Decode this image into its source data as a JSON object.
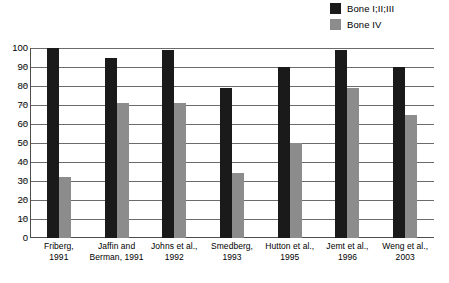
{
  "chart_data": {
    "type": "bar",
    "title": "",
    "subtitle": "",
    "xlabel": "",
    "ylabel": "",
    "ylim": [
      0,
      100
    ],
    "ytick_step": 10,
    "yticks": [
      100,
      90,
      80,
      70,
      60,
      50,
      40,
      30,
      20,
      10,
      0
    ],
    "grid": true,
    "legend_position": "top-right",
    "categories": [
      "Friberg, 1991",
      "Jaffin and Berman, 1991",
      "Johns et al., 1992",
      "Smedberg, 1993",
      "Hutton et al., 1995",
      "Jemt et al., 1996",
      "Weng et al., 2003"
    ],
    "category_lines": [
      [
        "Friberg,",
        "1991"
      ],
      [
        "Jaffin and",
        "Berman, 1991"
      ],
      [
        "Johns et al.,",
        "1992"
      ],
      [
        "Smedberg,",
        "1993"
      ],
      [
        "Hutton et al.,",
        "1995"
      ],
      [
        "Jemt et al.,",
        "1996"
      ],
      [
        "Weng et al.,",
        "2003"
      ]
    ],
    "series": [
      {
        "name": "Bone I;II;III",
        "color": "#1a1a1a",
        "values": [
          100,
          95,
          99,
          79,
          90,
          99,
          90
        ]
      },
      {
        "name": "Bone IV",
        "color": "#8c8c8c",
        "values": [
          32,
          71,
          71,
          34,
          50,
          79,
          65
        ]
      }
    ]
  },
  "legend": {
    "items": [
      {
        "label": "Bone I;II;III",
        "color": "#1a1a1a"
      },
      {
        "label": "Bone IV",
        "color": "#8c8c8c"
      }
    ]
  },
  "axis": {
    "y_labels": [
      "100",
      "90",
      "80",
      "70",
      "60",
      "50",
      "40",
      "30",
      "20",
      "10",
      "0"
    ]
  }
}
